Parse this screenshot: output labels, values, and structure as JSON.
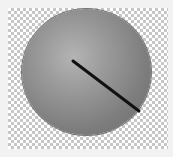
{
  "widget": {
    "type": "rotary-knob",
    "background": "transparent-checkerboard",
    "indicator": {
      "from": [
        73,
        61
      ],
      "to": [
        139,
        111
      ],
      "color": "#111111"
    },
    "colors": {
      "knob_highlight": "#b4b4b4",
      "knob_shadow": "#6a6a6a",
      "checker_light": "#ffffff",
      "checker_dark": "#c6c6c6"
    }
  }
}
